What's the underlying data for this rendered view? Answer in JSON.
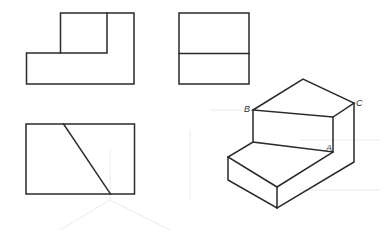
{
  "diagram": {
    "views": {
      "front_view": {
        "name": "front-view"
      },
      "side_view": {
        "name": "side-view"
      },
      "top_view": {
        "name": "top-view"
      },
      "isometric_view": {
        "name": "isometric-view"
      }
    },
    "labels": {
      "A": "A",
      "B": "B",
      "C": "C"
    },
    "colors": {
      "line": "#2a2a2a",
      "background": "#ffffff"
    }
  }
}
